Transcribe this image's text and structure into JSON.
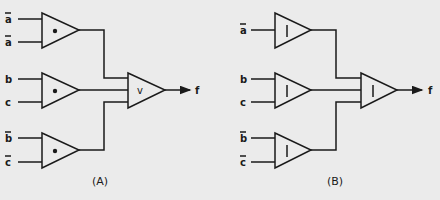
{
  "diagram_a": {
    "caption": "(A)",
    "gates": [
      {
        "symbol": "•",
        "inputs": [
          "a",
          "a"
        ],
        "negated": [
          true,
          true
        ]
      },
      {
        "symbol": "•",
        "inputs": [
          "b",
          "c"
        ],
        "negated": [
          false,
          false
        ]
      },
      {
        "symbol": "•",
        "inputs": [
          "b",
          "c"
        ],
        "negated": [
          true,
          true
        ]
      }
    ],
    "output_gate": {
      "symbol": "v"
    },
    "output_label": "f"
  },
  "diagram_b": {
    "caption": "(B)",
    "gates": [
      {
        "symbol": "|",
        "inputs": [
          "a"
        ],
        "negated": [
          true
        ]
      },
      {
        "symbol": "|",
        "inputs": [
          "b",
          "c"
        ],
        "negated": [
          false,
          false
        ]
      },
      {
        "symbol": "|",
        "inputs": [
          "b",
          "c"
        ],
        "negated": [
          true,
          true
        ]
      }
    ],
    "output_gate": {
      "symbol": "|"
    },
    "output_label": "f"
  },
  "colors": {
    "background": "#ebebeb",
    "ink": "#1a1a1a"
  }
}
